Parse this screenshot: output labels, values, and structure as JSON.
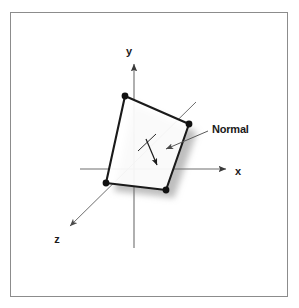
{
  "figure": {
    "background_color": "#ffffff",
    "border_color": "#808080",
    "ink_color": "#1a1a1a",
    "axis_color": "#6e6e6e",
    "shadow_color": "#b3b3b3",
    "axes": [
      {
        "id": "x",
        "label": "x",
        "label_x": 238,
        "label_y": 175
      },
      {
        "id": "y",
        "label": "y",
        "label_x": 129,
        "label_y": 55
      },
      {
        "id": "z",
        "label": "z",
        "label_x": 57,
        "label_y": 243
      }
    ],
    "annotations": [
      {
        "id": "normal",
        "label": "Normal",
        "label_x": 212,
        "label_y": 133
      }
    ],
    "polygon": {
      "name": "quadrilateral",
      "vertices": [
        {
          "id": "top-left",
          "x": 125,
          "y": 96
        },
        {
          "id": "right",
          "x": 189,
          "y": 124
        },
        {
          "id": "bottom-right",
          "x": 166,
          "y": 190
        },
        {
          "id": "bottom-left",
          "x": 106,
          "y": 183
        }
      ],
      "vertex_marker": "filled-dot",
      "vertex_radius": 3.2,
      "fill": "#ffffff",
      "stroke": "#1a1a1a"
    },
    "normal_vector": {
      "from": {
        "x": 146,
        "y": 140
      },
      "to": {
        "x": 157,
        "y": 164
      },
      "tick_from": {
        "x": 138,
        "y": 150
      },
      "tick_to": {
        "x": 155,
        "y": 135
      }
    }
  }
}
